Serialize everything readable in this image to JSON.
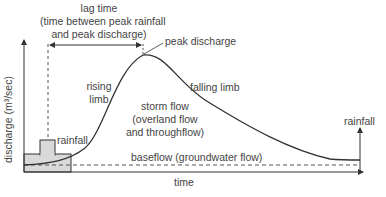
{
  "axes": {
    "y_label": "discharge (m³/sec)",
    "x_label": "time"
  },
  "labels": {
    "lag_time_title": "lag time",
    "lag_time_line1": "(time between peak rainfall",
    "lag_time_line2": "and peak discharge)",
    "peak_discharge": "peak discharge",
    "rising_limb_1": "rising",
    "rising_limb_2": "limb",
    "falling_limb": "falling limb",
    "storm_flow_1": "storm flow",
    "storm_flow_2": "(overland flow",
    "storm_flow_3": "and throughflow)",
    "rainfall_left": "rainfall",
    "rainfall_right": "rainfall",
    "baseflow": "baseflow (groundwater flow)"
  },
  "colors": {
    "line": "#333333",
    "rainfall_fill": "#d9d9d9",
    "dashed": "#555555",
    "text": "#444444"
  }
}
